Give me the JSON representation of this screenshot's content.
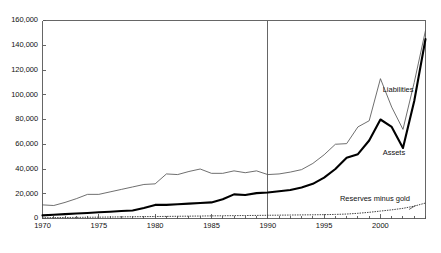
{
  "chart_data": {
    "type": "line",
    "title": "",
    "subtitle": "",
    "xlabel": "",
    "ylabel": "",
    "xlim": [
      1970,
      2004
    ],
    "ylim": [
      0,
      160000
    ],
    "ytick_values": [
      0,
      20000,
      40000,
      60000,
      80000,
      100000,
      120000,
      140000,
      160000
    ],
    "ytick_labels": [
      "0",
      "20,000",
      "40,000",
      "60,000",
      "80,000",
      "100,000",
      "120,000",
      "140,000",
      "160,000"
    ],
    "xtick_values": [
      1970,
      1975,
      1980,
      1985,
      1990,
      1995,
      2000
    ],
    "xtick_labels": [
      "1970",
      "1975",
      "1980",
      "1985",
      "1990",
      "1995",
      "2000"
    ],
    "minor_xticks": "annual",
    "grid": false,
    "legend_position": "inline-annotations",
    "annotations": [
      {
        "name": "liabilities-label",
        "text": "Liabilities",
        "x": 2000.2,
        "y": 104000
      },
      {
        "name": "assets-label",
        "text": "Assets",
        "x": 2000.2,
        "y": 53000
      },
      {
        "name": "reserves-label",
        "text": "Reserves minus gold",
        "x": 1996.4,
        "y": 15500
      }
    ],
    "reference_lines": [
      {
        "name": "year-1990-marker",
        "orientation": "vertical",
        "x": 1990,
        "color": "#555555"
      }
    ],
    "x": [
      1970,
      1971,
      1972,
      1973,
      1974,
      1975,
      1976,
      1977,
      1978,
      1979,
      1980,
      1981,
      1982,
      1983,
      1984,
      1985,
      1986,
      1987,
      1988,
      1989,
      1990,
      1991,
      1992,
      1993,
      1994,
      1995,
      1996,
      1997,
      1998,
      1999,
      2000,
      2001,
      2002,
      2003,
      2004
    ],
    "series": [
      {
        "name": "Liabilities",
        "style": "thin-solid",
        "color": "#555555",
        "values": [
          11000,
          10500,
          13000,
          16000,
          19500,
          19500,
          21500,
          23500,
          25500,
          27500,
          28000,
          36000,
          35500,
          38000,
          40000,
          36500,
          36500,
          38500,
          37000,
          38500,
          35500,
          36000,
          37500,
          39500,
          44500,
          51500,
          60000,
          60500,
          74000,
          79000,
          113000,
          90000,
          72000,
          110000,
          152000
        ]
      },
      {
        "name": "Assets",
        "style": "thick-solid",
        "color": "#000000",
        "values": [
          2500,
          3000,
          3500,
          4000,
          4500,
          5000,
          5500,
          6000,
          6500,
          8500,
          11000,
          11000,
          11500,
          12000,
          12500,
          13000,
          15500,
          19500,
          19000,
          20500,
          21000,
          22000,
          23000,
          25000,
          28000,
          33000,
          40000,
          49000,
          52000,
          63000,
          80000,
          74000,
          57000,
          95000,
          145000
        ]
      },
      {
        "name": "Reserves minus gold",
        "style": "dotted",
        "color": "#444444",
        "values": [
          600,
          700,
          800,
          900,
          1000,
          1100,
          1200,
          1300,
          1400,
          1500,
          1600,
          1700,
          1800,
          1900,
          2000,
          2100,
          2200,
          2300,
          2400,
          2500,
          2600,
          2700,
          2800,
          2900,
          3000,
          3100,
          3300,
          3600,
          4200,
          5000,
          6000,
          7000,
          8200,
          10000,
          12500
        ]
      }
    ]
  },
  "axes": {
    "frame_color": "#555555"
  }
}
